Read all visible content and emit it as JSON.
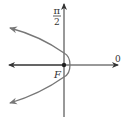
{
  "diagram": {
    "type": "polar-parabola",
    "labels": {
      "angle_pi": "π",
      "angle_2": "2",
      "polar_axis": "0",
      "focus": "F"
    },
    "colors": {
      "axis": "#333333",
      "curve": "#777777",
      "background": "#ffffff"
    }
  }
}
